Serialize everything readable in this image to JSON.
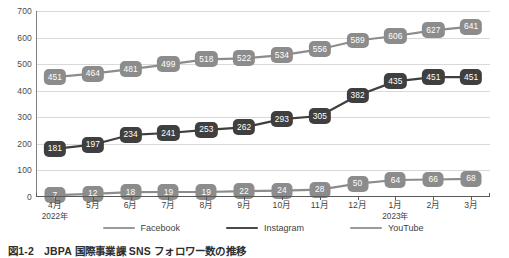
{
  "chart_data": {
    "type": "line",
    "title": "",
    "xlabel": "",
    "ylabel": "",
    "ylim": [
      0,
      700
    ],
    "yticks": [
      0,
      100,
      200,
      300,
      400,
      500,
      600,
      700
    ],
    "grid": true,
    "legend_position": "bottom",
    "categories": [
      "4月",
      "5月",
      "6月",
      "7月",
      "8月",
      "9月",
      "10月",
      "11月",
      "12月",
      "1月",
      "2月",
      "3月"
    ],
    "category_years": [
      "2022年",
      "",
      "",
      "",
      "",
      "",
      "",
      "",
      "",
      "2023年",
      "",
      ""
    ],
    "series": [
      {
        "name": "YouTube",
        "color": "#8c8c8c",
        "values": [
          451,
          464,
          481,
          499,
          518,
          522,
          534,
          556,
          589,
          606,
          627,
          641
        ]
      },
      {
        "name": "Instagram",
        "color": "#3f3f3f",
        "values": [
          181,
          197,
          234,
          241,
          253,
          262,
          293,
          305,
          382,
          435,
          451,
          451
        ]
      },
      {
        "name": "Facebook",
        "color": "#8c8c8c",
        "values": [
          7,
          12,
          18,
          19,
          19,
          22,
          24,
          28,
          50,
          64,
          66,
          68
        ]
      }
    ]
  },
  "legend": {
    "items": [
      {
        "label": "Facebook",
        "color": "#9a9a9a"
      },
      {
        "label": "Instagram",
        "color": "#4a4a4a"
      },
      {
        "label": "YouTube",
        "color": "#9a9a9a"
      }
    ]
  },
  "caption": {
    "number": "図1-2",
    "text": "JBPA 国際事業課 SNS フォロワー数の推移"
  },
  "colors": {
    "gridline": "#d9d9d9",
    "axis": "#5a5a5a",
    "background": "#ffffff",
    "label_text": "#ffffff"
  }
}
